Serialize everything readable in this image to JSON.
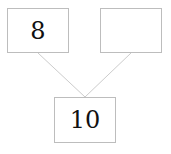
{
  "diagram": {
    "type": "tree",
    "nodes": [
      {
        "id": "left",
        "label": "8",
        "x": 7,
        "y": 8,
        "w": 62,
        "h": 45
      },
      {
        "id": "right",
        "label": "",
        "x": 100,
        "y": 8,
        "w": 62,
        "h": 45
      },
      {
        "id": "root",
        "label": "10",
        "x": 54,
        "y": 97,
        "w": 62,
        "h": 46
      }
    ],
    "edges": [
      {
        "from": "left",
        "to": "root"
      },
      {
        "from": "right",
        "to": "root"
      }
    ],
    "colors": {
      "border": "#bdbdbd",
      "edge": "#cccccc",
      "text": "#111111"
    }
  }
}
